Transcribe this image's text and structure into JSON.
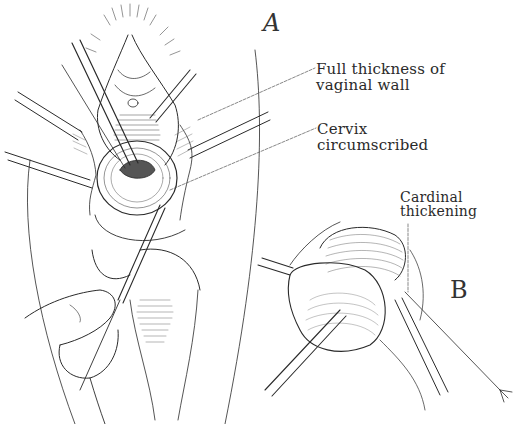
{
  "figure": {
    "panels": [
      {
        "id": "A",
        "letter": "A",
        "description": "Vaginal approach view with retractors and forceps; cervix circumscribed"
      },
      {
        "id": "B",
        "letter": "B",
        "description": "Uterus/cervix drawn down with clamps at cardinal ligament"
      }
    ],
    "labels": {
      "full_thickness": {
        "line1": "Full thickness of",
        "line2": "vaginal wall"
      },
      "cervix": {
        "line1": "Cervix",
        "line2": "circumscribed"
      },
      "cardinal": {
        "line1": "Cardinal",
        "line2": "thickening"
      }
    },
    "colors": {
      "ink": "#2a2a2a",
      "background": "#ffffff",
      "leader": "#555555"
    }
  }
}
